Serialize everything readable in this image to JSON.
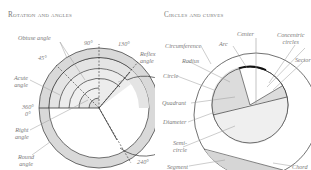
{
  "left_panel": {
    "title": "Rotation and angles",
    "labels": {
      "obtuse": "Obtuse angle",
      "deg90": "90°",
      "deg130": "130°",
      "reflex1": "Reflex",
      "reflex2": "angle",
      "deg45": "45°",
      "acute1": "Acute",
      "acute2": "angle",
      "deg360": "360°",
      "deg0": "0°",
      "right1": "Right",
      "right2": "angle",
      "round1": "Round",
      "round2": "angle",
      "deg240": "240°"
    }
  },
  "right_panel": {
    "title": "Circles and curves",
    "labels": {
      "center": "Center",
      "concentric1": "Concentric",
      "concentric2": "circles",
      "circumference": "Circumference",
      "arc": "Arc",
      "radius": "Radius",
      "sector": "Sector",
      "circle": "Circle",
      "quadrant": "Quadrant",
      "diameter": "Diameter",
      "semi1": "Semi-",
      "semi2": "circle",
      "segment": "Segment",
      "chord": "Chord"
    }
  },
  "colors": {
    "fill_gray": "#d9d9d9",
    "fill_light": "#ececec",
    "stroke": "#333333",
    "leader": "#9a9a9a"
  }
}
